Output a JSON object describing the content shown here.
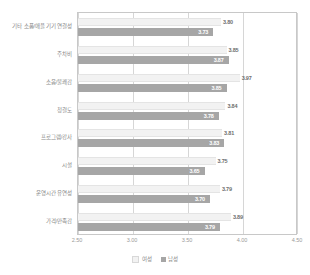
{
  "chart_data": {
    "type": "bar",
    "orientation": "horizontal",
    "title": "",
    "xlabel": "",
    "ylabel": "",
    "xlim": [
      2.5,
      4.5
    ],
    "xticks": [
      "2.50",
      "3.00",
      "3.50",
      "4.00",
      "4.50"
    ],
    "grid": true,
    "legend_position": "bottom",
    "categories": [
      "기타 소품/애플 기기 연결성",
      "주차비",
      "소음/불쾌감",
      "청결도",
      "프로그램/강사",
      "시설",
      "운영시간 유연성",
      "가격/만족감"
    ],
    "series": [
      {
        "name": "여성",
        "color": "#f2f2f2",
        "values": [
          3.8,
          3.85,
          3.97,
          3.84,
          3.81,
          3.75,
          3.79,
          3.89
        ],
        "labels": [
          "3.80",
          "3.85",
          "3.97",
          "3.84",
          "3.81",
          "3.75",
          "3.79",
          "3.89"
        ]
      },
      {
        "name": "남성",
        "color": "#a6a6a6",
        "values": [
          3.73,
          3.87,
          3.85,
          3.78,
          3.83,
          3.65,
          3.7,
          3.79
        ],
        "labels": [
          "3.73",
          "3.87",
          "3.85",
          "3.78",
          "3.83",
          "3.65",
          "3.70",
          "3.79"
        ]
      }
    ]
  }
}
